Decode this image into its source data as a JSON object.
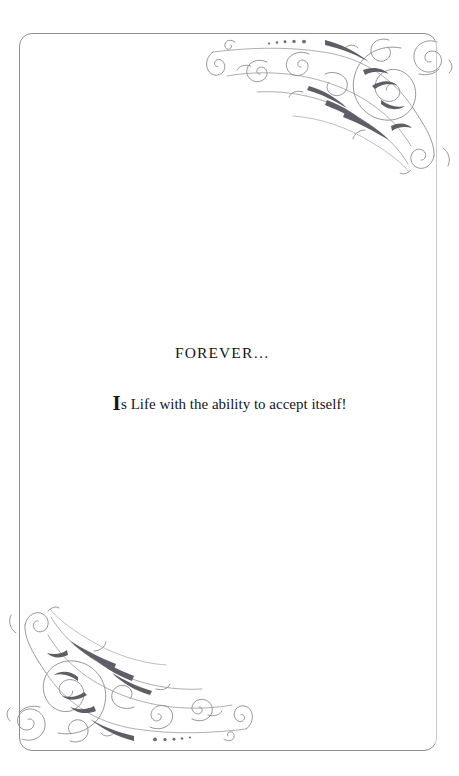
{
  "page": {
    "background_color": "#ffffff",
    "frame": {
      "name": "decorative-page-border",
      "color": "#8d8d93",
      "style": "thin rounded rectangle"
    }
  },
  "ornaments": {
    "accent_color": "#6e6e76",
    "light_color": "#a6a6ad",
    "top_right": {
      "name": "corner-flourish-top-right",
      "description": "victorian scrollwork with spirals and beaded taper"
    },
    "bottom_left": {
      "name": "corner-flourish-bottom-left",
      "description": "victorian scrollwork rotated 180 degrees"
    }
  },
  "content": {
    "heading": "FOREVER…",
    "body": {
      "dropcap": "I",
      "rest": "s Life with the ability to accept itself!"
    }
  }
}
